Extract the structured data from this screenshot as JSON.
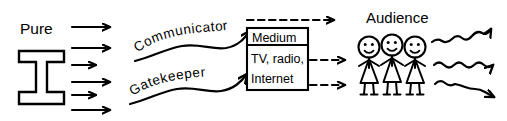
{
  "diagram": {
    "type": "flow-diagram",
    "colors": {
      "ink": "#000000",
      "background": "#ffffff"
    },
    "source": {
      "label": "Pure",
      "shape_name": "i-beam-shape",
      "outgoing_arrow_count": 5
    },
    "intermediaries": [
      {
        "label": "Communicator",
        "style": "curved-text-with-wavy-arrow",
        "position": "upper"
      },
      {
        "label": "Gatekeeper",
        "style": "curved-text-with-wavy-arrow",
        "position": "lower"
      }
    ],
    "medium": {
      "header": "Medium",
      "lines": [
        "TV, radio,",
        "Internet"
      ],
      "outgoing_dashed_arrow_count": 3
    },
    "audience": {
      "label": "Audience",
      "figure_count": 3,
      "figures": [
        "stick-figure-left",
        "stick-figure-center",
        "stick-figure-right"
      ],
      "outgoing_wavy_arrow_count": 3
    }
  }
}
